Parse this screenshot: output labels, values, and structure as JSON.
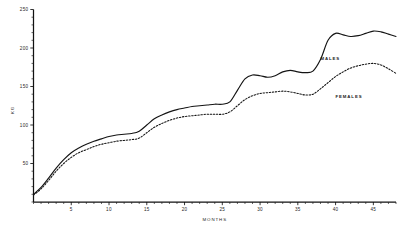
{
  "chart_data": {
    "type": "line",
    "title": "",
    "xlabel": "MONTHS",
    "ylabel": "KG",
    "xlim": [
      0,
      48
    ],
    "ylim": [
      0,
      250
    ],
    "grid": false,
    "legend_position": "inline-annotation",
    "x_ticks_major": [
      5,
      10,
      15,
      20,
      25,
      30,
      35,
      40,
      45
    ],
    "x_tick_labels": [
      "5",
      "10",
      "15",
      "20",
      "25",
      "30",
      "35",
      "40",
      "45"
    ],
    "x_tick_minor_step": 1,
    "y_ticks_major": [
      50,
      100,
      150,
      200,
      250
    ],
    "y_tick_labels": [
      "50",
      "100",
      "150",
      "200",
      "250"
    ],
    "y_tick_minor_step": 10,
    "x": [
      0,
      1,
      2,
      3,
      4,
      5,
      6,
      7,
      8,
      9,
      10,
      11,
      12,
      13,
      14,
      15,
      16,
      17,
      18,
      19,
      20,
      21,
      22,
      23,
      24,
      25,
      26,
      27,
      28,
      29,
      30,
      31,
      32,
      33,
      34,
      35,
      36,
      37,
      38,
      39,
      40,
      41,
      42,
      43,
      44,
      45,
      46,
      47,
      48
    ],
    "series": [
      {
        "name": "MALES",
        "style": "solid",
        "color": "#141414",
        "label_month": 38,
        "label_value": 185,
        "values": [
          10,
          19,
          31,
          44,
          55,
          64,
          70,
          75,
          79,
          82,
          85,
          87,
          88,
          89,
          92,
          100,
          108,
          113,
          117,
          120,
          122,
          124,
          125,
          126,
          127,
          127,
          130,
          145,
          160,
          165,
          164,
          162,
          164,
          169,
          171,
          169,
          168,
          170,
          185,
          210,
          219,
          217,
          215,
          216,
          219,
          222,
          221,
          218,
          215
        ]
      },
      {
        "name": "FEMALES",
        "style": "dotted",
        "color": "#141414",
        "label_month": 40,
        "label_value": 135,
        "values": [
          9,
          17,
          28,
          40,
          50,
          58,
          64,
          68,
          72,
          75,
          77,
          79,
          80,
          81,
          83,
          90,
          97,
          102,
          106,
          109,
          111,
          112,
          113,
          114,
          114,
          114,
          117,
          125,
          133,
          138,
          141,
          142,
          143,
          144,
          143,
          141,
          139,
          140,
          147,
          155,
          163,
          169,
          174,
          177,
          179,
          180,
          178,
          173,
          167
        ]
      }
    ]
  },
  "axes": {
    "y_title": "KG",
    "x_title": "MONTHS"
  }
}
